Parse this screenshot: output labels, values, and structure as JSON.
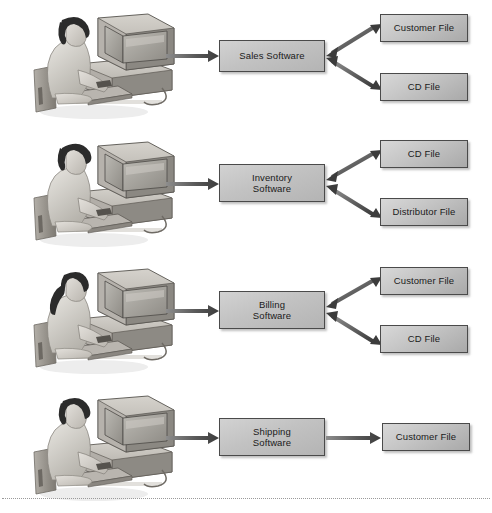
{
  "figure": {
    "colors": {
      "box_border": "#4a4a4a",
      "software_fill": "#c2c2c2",
      "file_fill": "#c6c6c6",
      "arrow": "#4f4f4f",
      "text": "#1a1a1a",
      "background": "#ffffff",
      "rule": "#9a9a9a"
    }
  },
  "rows": [
    {
      "id": "sales",
      "operator": "person-at-computer",
      "software": {
        "label": "Sales Software",
        "lines": [
          "Sales Software"
        ]
      },
      "files": [
        {
          "label": "Customer File",
          "link": "bidirectional"
        },
        {
          "label": "CD File",
          "link": "bidirectional"
        }
      ],
      "input_arrow": "unidirectional"
    },
    {
      "id": "inventory",
      "operator": "person-at-computer",
      "software": {
        "label": "Inventory Software",
        "lines": [
          "Inventory",
          "Software"
        ]
      },
      "files": [
        {
          "label": "CD File",
          "link": "bidirectional"
        },
        {
          "label": "Distributor File",
          "link": "bidirectional"
        }
      ],
      "input_arrow": "unidirectional"
    },
    {
      "id": "billing",
      "operator": "person-at-computer",
      "software": {
        "label": "Billing Software",
        "lines": [
          "Billing",
          "Software"
        ]
      },
      "files": [
        {
          "label": "Customer File",
          "link": "bidirectional"
        },
        {
          "label": "CD File",
          "link": "bidirectional"
        }
      ],
      "input_arrow": "unidirectional"
    },
    {
      "id": "shipping",
      "operator": "person-at-computer",
      "software": {
        "label": "Shipping Software",
        "lines": [
          "Shipping",
          "Software"
        ]
      },
      "files": [
        {
          "label": "Customer File",
          "link": "unidirectional"
        }
      ],
      "input_arrow": "unidirectional"
    }
  ],
  "labels": {
    "row1_software": "Sales Software",
    "row1_file1": "Customer File",
    "row1_file2": "CD File",
    "row2_software": "Inventory\nSoftware",
    "row2_file1": "CD File",
    "row2_file2": "Distributor File",
    "row3_software": "Billing\nSoftware",
    "row3_file1": "Customer File",
    "row3_file2": "CD File",
    "row4_software": "Shipping\nSoftware",
    "row4_file1": "Customer File"
  },
  "icons": {
    "operator": "person-at-computer-icon",
    "arrow_single": "arrow-right-icon",
    "arrow_double": "arrow-double-headed-icon"
  }
}
